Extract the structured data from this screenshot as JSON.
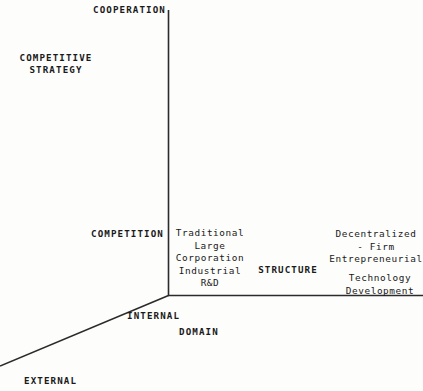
{
  "diagram": {
    "type": "three-axis-conceptual-diagram",
    "background_color": "#fdfdfc",
    "line_color": "#2b2b2b",
    "text_color": "#1a1a1a",
    "axes": {
      "origin": {
        "x": 168,
        "y": 295
      },
      "vertical": {
        "name": "competitive-strategy-axis",
        "from": {
          "x": 168,
          "y": 10
        },
        "to": {
          "x": 168,
          "y": 295
        },
        "axis_title": "COMPETITIVE\nSTRATEGY",
        "high_end_label": "COOPERATION",
        "low_end_label": "COMPETITION"
      },
      "horizontal": {
        "name": "structure-axis",
        "from": {
          "x": 168,
          "y": 295
        },
        "to": {
          "x": 423,
          "y": 295
        },
        "axis_title": "STRUCTURE"
      },
      "diagonal": {
        "name": "domain-axis",
        "from": {
          "x": 168,
          "y": 295
        },
        "to": {
          "x": 0,
          "y": 366
        },
        "axis_title": "DOMAIN",
        "near_end_label": "INTERNAL",
        "far_end_label": "EXTERNAL"
      }
    },
    "labels": {
      "cooperation": "COOPERATION",
      "competitive_strategy_line1": "COMPETITIVE",
      "competitive_strategy_line2": "STRATEGY",
      "competition": "COMPETITION",
      "structure": "STRUCTURE",
      "internal": "INTERNAL",
      "external": "EXTERNAL",
      "domain": "DOMAIN"
    },
    "items": {
      "traditional_corporation": "Traditional\nLarge\nCorporation\nIndustrial\nR&D",
      "decentralized_firm": "Decentralized\n- Firm\nEntrepreneurial",
      "technology_development": "Technology\nDevelopment"
    }
  }
}
